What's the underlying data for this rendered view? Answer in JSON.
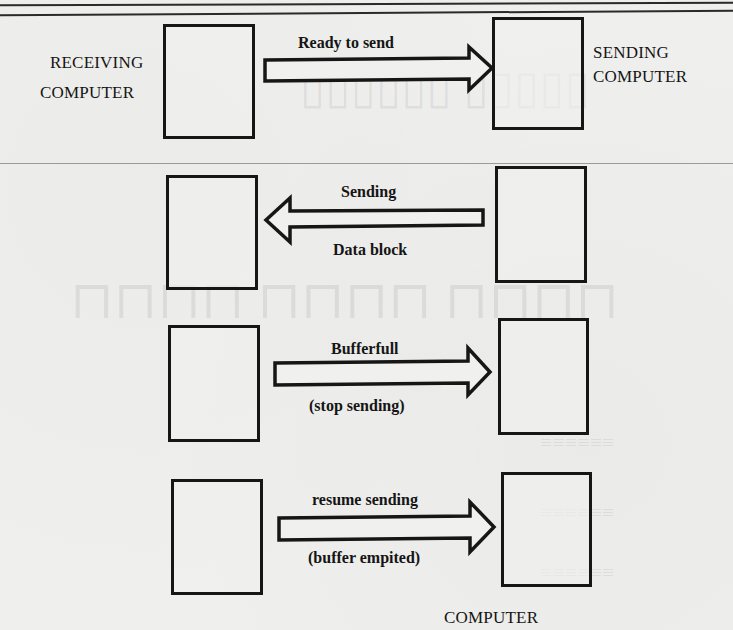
{
  "diagram": {
    "nodes": {
      "receiving_computer": {
        "label_line1": "RECEIVING",
        "label_line2": "COMPUTER"
      },
      "sending_computer": {
        "label_line1": "SENDING",
        "label_line2": "COMPUTER"
      },
      "bottom_computer": {
        "label": "COMPUTER"
      }
    },
    "steps": [
      {
        "direction": "right",
        "label_top": "Ready to send",
        "label_bottom": ""
      },
      {
        "direction": "left",
        "label_top": "Sending",
        "label_bottom": "Data block"
      },
      {
        "direction": "right",
        "label_top": "Bufferfull",
        "label_bottom": "(stop sending)"
      },
      {
        "direction": "right",
        "label_top": "resume sending",
        "label_bottom": "(buffer empited)"
      }
    ],
    "colors": {
      "ink": "#161616",
      "paper": "#efefed"
    }
  }
}
